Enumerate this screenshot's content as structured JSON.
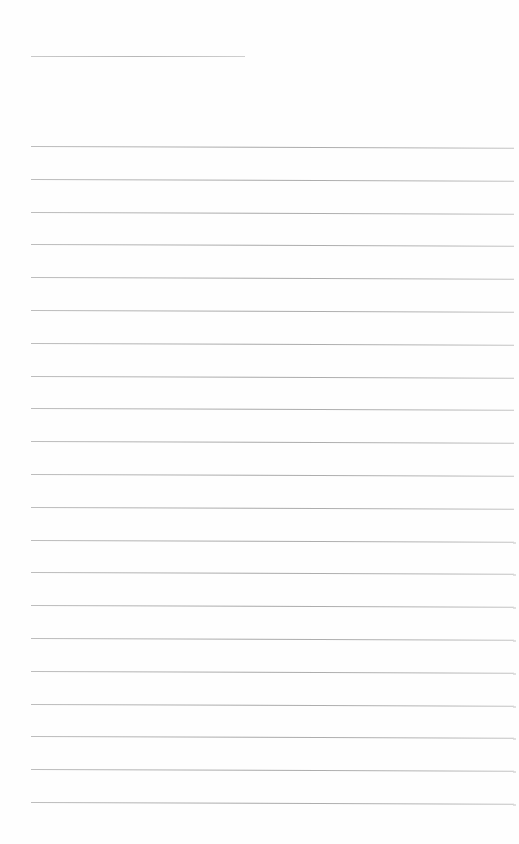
{
  "page": {
    "type": "ruled-writing-sheet",
    "background_color": "#fefefe",
    "line_color": "#b0b0b0",
    "header_line": {
      "x": 31,
      "y": 56,
      "width": 214
    },
    "ruled_lines": {
      "count": 21,
      "start_y": 146,
      "spacing": 32.8,
      "left": 31,
      "width": 483
    },
    "text_content": []
  }
}
